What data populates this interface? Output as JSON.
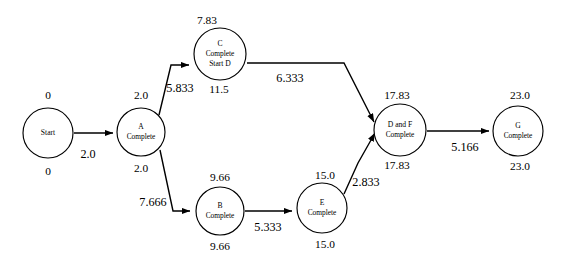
{
  "diagram": {
    "type": "project-network-pert-cpm",
    "title": "",
    "nodes": [
      {
        "id": "start",
        "lines": [
          "Start"
        ],
        "cx": 48,
        "cy": 133,
        "r": 25,
        "early_time": "0",
        "late_time": "0",
        "early_x": 48,
        "early_y": 96,
        "late_x": 48,
        "late_y": 172
      },
      {
        "id": "a",
        "lines": [
          "A",
          "Complete"
        ],
        "cx": 141,
        "cy": 132,
        "r": 24,
        "early_time": "2.0",
        "late_time": "2.0",
        "early_x": 141,
        "early_y": 96,
        "late_x": 141,
        "late_y": 169
      },
      {
        "id": "c",
        "lines": [
          "C",
          "Complete",
          "Start D"
        ],
        "cx": 220,
        "cy": 54,
        "r": 26,
        "early_time": "7.83",
        "late_time": "11.5",
        "early_x": 207,
        "early_y": 21,
        "late_x": 219,
        "late_y": 90
      },
      {
        "id": "b",
        "lines": [
          "B",
          "Complete"
        ],
        "cx": 220,
        "cy": 211,
        "r": 24,
        "early_time": "9.66",
        "late_time": "9.66",
        "early_x": 220,
        "early_y": 178,
        "late_x": 220,
        "late_y": 247
      },
      {
        "id": "e",
        "lines": [
          "E",
          "Complete"
        ],
        "cx": 322,
        "cy": 208,
        "r": 25,
        "early_time": "15.0",
        "late_time": "15.0",
        "early_x": 325,
        "early_y": 176,
        "late_x": 325,
        "late_y": 245
      },
      {
        "id": "df",
        "lines": [
          "D and F",
          "Complete"
        ],
        "cx": 400,
        "cy": 130,
        "r": 26,
        "early_time": "17.83",
        "late_time": "17.83",
        "early_x": 397,
        "early_y": 96,
        "late_x": 397,
        "late_y": 166
      },
      {
        "id": "g",
        "lines": [
          "G",
          "Complete"
        ],
        "cx": 518,
        "cy": 131,
        "r": 25,
        "early_time": "23.0",
        "late_time": "23.0",
        "early_x": 520,
        "early_y": 96,
        "late_x": 520,
        "late_y": 167
      }
    ],
    "edges": [
      {
        "id": "start-a",
        "from": "start",
        "to": "a",
        "label": "2.0",
        "label_x": 88,
        "label_y": 155,
        "path": "M 74 133 L 113 133"
      },
      {
        "id": "a-c",
        "from": "a",
        "to": "c",
        "label": "5.833",
        "label_x": 180,
        "label_y": 89,
        "path": "M 159 115 L 171 65 L 189 65"
      },
      {
        "id": "a-b",
        "from": "a",
        "to": "b",
        "label": "7.666",
        "label_x": 153,
        "label_y": 203,
        "path": "M 160 150 L 173 211 L 190 211"
      },
      {
        "id": "c-df",
        "from": "c",
        "to": "df",
        "label": "6.333",
        "label_x": 290,
        "label_y": 79,
        "path": "M 247 63 L 344 63 L 374 122"
      },
      {
        "id": "b-e",
        "from": "b",
        "to": "e",
        "label": "5.333",
        "label_x": 268,
        "label_y": 228,
        "path": "M 245 211 L 292 211"
      },
      {
        "id": "e-df",
        "from": "e",
        "to": "df",
        "label": "2.833",
        "label_x": 366,
        "label_y": 183,
        "path": "M 344 194 L 358 163 L 375 133"
      },
      {
        "id": "df-g",
        "from": "df",
        "to": "g",
        "label": "5.166",
        "label_x": 465,
        "label_y": 148,
        "path": "M 427 131 L 489 131"
      }
    ]
  }
}
